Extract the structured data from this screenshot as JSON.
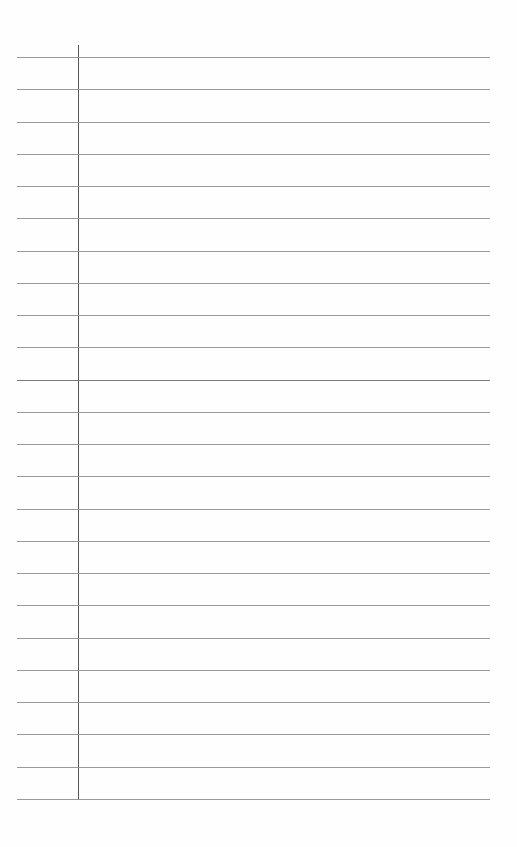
{
  "page": {
    "type": "lined notebook paper",
    "background": "#fefefe",
    "rule_color": "#9a9a9a",
    "margin_color": "#555555",
    "rule_count": 24,
    "first_rule_y": 57,
    "rule_spacing": 32.26,
    "rule_left": 17,
    "rule_right": 490,
    "margin_x": 78,
    "dark_rule_index": 10
  }
}
